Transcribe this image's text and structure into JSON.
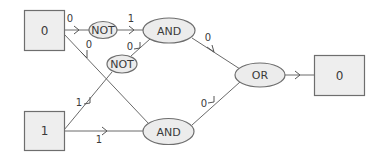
{
  "inputs": [
    {
      "id": "in-a",
      "value": "0"
    },
    {
      "id": "in-b",
      "value": "1"
    }
  ],
  "output": {
    "value": "0"
  },
  "gates": {
    "not_top": "NOT",
    "not_mid": "NOT",
    "and_top": "AND",
    "and_bottom": "AND",
    "or": "OR"
  },
  "wires": {
    "a_to_not_top": "0",
    "a_to_and_bottom": "0",
    "not_top_to_and_top": "1",
    "not_mid_to_and_top": "0",
    "b_to_not_mid": "1",
    "b_to_and_bottom": "1",
    "and_top_to_or": "0",
    "and_bottom_to_or": "0"
  },
  "colors": {
    "box_fill": "#eeeeee",
    "gate_fill": "#ececec",
    "stroke": "#6e6e6e"
  }
}
